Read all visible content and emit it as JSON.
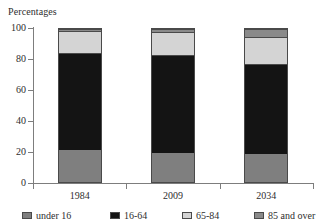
{
  "chart_data": {
    "type": "bar",
    "subtype": "stacked-100-percent",
    "title": "",
    "ylabel": "Percentages",
    "xlabel": "",
    "ylim": [
      0,
      100
    ],
    "yticks": [
      0,
      20,
      40,
      60,
      80,
      100
    ],
    "ytick_labels": [
      "0",
      "20",
      "40",
      "60",
      "80",
      "100"
    ],
    "grid": false,
    "legend_position": "bottom",
    "categories": [
      "1984",
      "2009",
      "2034"
    ],
    "series": [
      {
        "name": "under 16",
        "values": [
          21,
          19,
          18
        ],
        "color": "#7f7f7f"
      },
      {
        "name": "16-64",
        "values": [
          64,
          64,
          59
        ],
        "color": "#141414"
      },
      {
        "name": "65-84",
        "values": [
          15,
          15,
          18
        ],
        "color": "#d4d4d4"
      },
      {
        "name": "85 and over",
        "values": [
          1,
          2,
          5
        ],
        "color": "#8a8a8a"
      }
    ]
  },
  "axis": {
    "y_title": "Percentages",
    "y_labels": [
      "100",
      "80",
      "60",
      "40",
      "20",
      "0"
    ],
    "x_labels": [
      "1984",
      "2009",
      "2034"
    ]
  },
  "legend": {
    "items": [
      {
        "label": "under 16"
      },
      {
        "label": "16-64"
      },
      {
        "label": "65-84"
      },
      {
        "label": "85 and over"
      }
    ]
  }
}
